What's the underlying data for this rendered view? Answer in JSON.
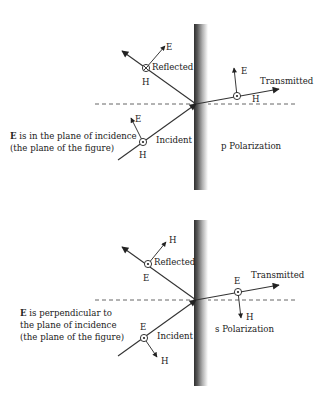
{
  "figure": {
    "panels": [
      {
        "id": "p",
        "polarization_label": "p Polarization",
        "description_lines": [
          "E is in the plane of incidence",
          "(the plane of the figure)"
        ],
        "description_bold_prefix": "E",
        "rays": {
          "reflected": {
            "label": "Reflected",
            "field_symbol": "H",
            "symbol_type": "into-page",
            "arrow_field": "E"
          },
          "incident": {
            "label": "Incident",
            "field_symbol": "H",
            "symbol_type": "out-of-page",
            "arrow_field": "E"
          },
          "transmitted": {
            "label": "Transmitted",
            "field_symbol": "H",
            "symbol_type": "out-of-page",
            "arrow_field": "E"
          }
        }
      },
      {
        "id": "s",
        "polarization_label": "s Polarization",
        "description_lines": [
          "E is perpendicular to",
          "the plane of incidence",
          "(the plane of the figure)"
        ],
        "description_bold_prefix": "E",
        "rays": {
          "reflected": {
            "label": "Reflected",
            "field_symbol": "E",
            "symbol_type": "out-of-page",
            "arrow_field": "H"
          },
          "incident": {
            "label": "Incident",
            "field_symbol": "E",
            "symbol_type": "out-of-page",
            "arrow_field": "H"
          },
          "transmitted": {
            "label": "Transmitted",
            "field_symbol": "E",
            "symbol_type": "out-of-page",
            "arrow_field": "H"
          }
        }
      }
    ],
    "text": {
      "p_desc_1_rest": " is in the plane of incidence",
      "p_desc_2": "(the plane of the figure)",
      "s_desc_1_rest": " is perpendicular to",
      "s_desc_2": "the plane of incidence",
      "s_desc_3": "(the plane of the figure)",
      "bold_E": "E",
      "E": "E",
      "H": "H",
      "reflected": "Reflected",
      "incident": "Incident",
      "transmitted": "Transmitted",
      "p_pol": "p Polarization",
      "s_pol": "s Polarization"
    },
    "colors": {
      "ink": "#222222",
      "wall_dark": "#3a3a3a",
      "wall_light": "#ffffff"
    }
  }
}
